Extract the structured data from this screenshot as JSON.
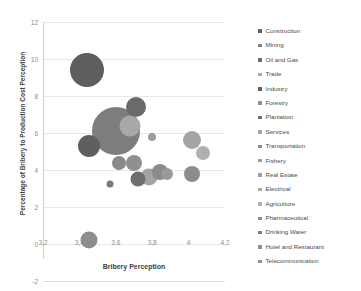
{
  "chart_data": {
    "type": "scatter",
    "title": "",
    "xlabel": "Bribery Perception",
    "ylabel": "Percentage of Bribery to Production Cost Perception",
    "xlim": [
      3.2,
      4.2
    ],
    "ylim": [
      -2,
      12
    ],
    "xticks": [
      "3,2",
      "3,4",
      "3,6",
      "3,8",
      "4",
      "4,2"
    ],
    "xtick_values": [
      3.2,
      3.4,
      3.6,
      3.8,
      4.0,
      4.2
    ],
    "yticks": [
      "12",
      "10",
      "8",
      "6",
      "4",
      "2",
      "0",
      "-2"
    ],
    "ytick_values": [
      12,
      10,
      8,
      6,
      4,
      2,
      0,
      -2
    ],
    "grid": "horizontal",
    "legend_position": "right",
    "bubble_note": "Bubble area encodes a third magnitude variable per industry",
    "series": [
      {
        "name": "Construction",
        "x": 3.44,
        "y": 9.4,
        "size": 34,
        "color": "#5e5e5e"
      },
      {
        "name": "Mining",
        "x": 3.6,
        "y": 6.1,
        "size": 48,
        "color": "#7d7d7d"
      },
      {
        "name": "Oil and Gas",
        "x": 3.71,
        "y": 7.4,
        "size": 20,
        "color": "#6a6a6a"
      },
      {
        "name": "Trade",
        "x": 3.68,
        "y": 6.4,
        "size": 21,
        "color": "#a8a8a8"
      },
      {
        "name": "Industry",
        "x": 3.45,
        "y": 5.3,
        "size": 22,
        "color": "#5f5f5f"
      },
      {
        "name": "Forestry",
        "x": 3.7,
        "y": 4.4,
        "size": 16,
        "color": "#8f8f8f"
      },
      {
        "name": "Plantation",
        "x": 3.72,
        "y": 3.5,
        "size": 15,
        "color": "#6e6e6e"
      },
      {
        "name": "Services",
        "x": 3.78,
        "y": 3.6,
        "size": 17,
        "color": "#a3a3a3"
      },
      {
        "name": "Transportation",
        "x": 3.84,
        "y": 3.9,
        "size": 16,
        "color": "#8a8a8a"
      },
      {
        "name": "Fishery",
        "x": 3.88,
        "y": 3.8,
        "size": 12,
        "color": "#9a9a9a"
      },
      {
        "name": "Real Estate",
        "x": 3.8,
        "y": 5.8,
        "size": 8,
        "color": "#9e9e9e"
      },
      {
        "name": "Electrical",
        "x": 4.02,
        "y": 5.6,
        "size": 18,
        "color": "#a5a5a5"
      },
      {
        "name": "Agriculture",
        "x": 4.08,
        "y": 4.9,
        "size": 14,
        "color": "#b0b0b0"
      },
      {
        "name": "Pharmaceutical",
        "x": 4.02,
        "y": 3.8,
        "size": 16,
        "color": "#8b8b8b"
      },
      {
        "name": "Drinking Water",
        "x": 3.57,
        "y": 3.25,
        "size": 7,
        "color": "#7a7a7a"
      },
      {
        "name": "Hotel and Restaurant",
        "x": 3.45,
        "y": 0.2,
        "size": 17,
        "color": "#8d8d8d"
      },
      {
        "name": "Telecommunication",
        "x": 3.62,
        "y": 4.4,
        "size": 14,
        "color": "#8a8a8a"
      }
    ]
  },
  "legend": {
    "items": [
      {
        "label": "Construction",
        "color": "#5e5e5e"
      },
      {
        "label": "Mining",
        "color": "#7d7d7d"
      },
      {
        "label": "Oil and Gas",
        "color": "#6a6a6a"
      },
      {
        "label": "Trade",
        "color": "#a8a8a8"
      },
      {
        "label": "Industry",
        "color": "#5f5f5f"
      },
      {
        "label": "Forestry",
        "color": "#8f8f8f"
      },
      {
        "label": "Plantation",
        "color": "#6e6e6e"
      },
      {
        "label": "Services",
        "color": "#a3a3a3"
      },
      {
        "label": "Transportation",
        "color": "#8a8a8a"
      },
      {
        "label": "Fishery",
        "color": "#9a9a9a"
      },
      {
        "label": "Real Estate",
        "color": "#9e9e9e"
      },
      {
        "label": "Electrical",
        "color": "#a5a5a5"
      },
      {
        "label": "Agriculture",
        "color": "#b0b0b0"
      },
      {
        "label": "Pharmaceutical",
        "color": "#8b8b8b"
      },
      {
        "label": "Drinking Water",
        "color": "#7a7a7a"
      },
      {
        "label": "Hotel and Restaurant",
        "color": "#8d8d8d"
      },
      {
        "label": "Telecommunication",
        "color": "#9090 90"
      }
    ]
  },
  "colors": {
    "gridline": "#e8e8e8",
    "axis": "#d0d0d0",
    "tick_text": "#8c8c8c",
    "title_text": "#404040",
    "legend_text": "#4a4a4a",
    "background": "#ffffff"
  }
}
